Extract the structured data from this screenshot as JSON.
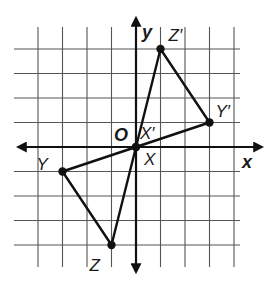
{
  "figure": {
    "type": "coordinate-grid-reflection",
    "grid": {
      "x_range": [
        -4,
        4
      ],
      "y_range": [
        -4,
        4
      ],
      "cell_px": 24.5,
      "origin_px": [
        136,
        147
      ]
    },
    "axes": {
      "x_label": "x",
      "y_label": "y",
      "origin_label": "O"
    },
    "triangles": [
      {
        "name": "XYZ",
        "vertices": [
          {
            "label": "X",
            "coord": [
              0,
              0
            ]
          },
          {
            "label": "Y",
            "coord": [
              -3,
              -1
            ]
          },
          {
            "label": "Z",
            "coord": [
              -1,
              -4
            ]
          }
        ]
      },
      {
        "name": "X'Y'Z'",
        "vertices": [
          {
            "label": "X′",
            "coord": [
              0,
              0
            ]
          },
          {
            "label": "Y′",
            "coord": [
              3,
              1
            ]
          },
          {
            "label": "Z′",
            "coord": [
              1,
              4
            ]
          }
        ]
      }
    ],
    "colors": {
      "grid": "#555555",
      "axis": "#111111",
      "triangle": "#111111",
      "background": "#ffffff"
    }
  }
}
